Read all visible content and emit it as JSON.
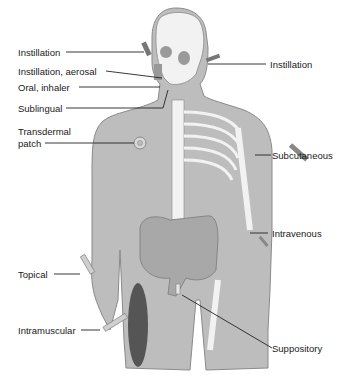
{
  "diagram": {
    "colors": {
      "body": "#bdbdbd",
      "body_outline": "#8a8a8a",
      "bone": "#f2f2f2",
      "organ": "#a8a8a8",
      "muscle": "#555555",
      "leader": "#222222",
      "text": "#1a1a1a"
    },
    "labels": {
      "instillation_eye": "Instillation",
      "instillation_aerosal": "Instillation, aerosal",
      "oral_inhaler": "Oral, inhaler",
      "sublingual": "Sublingual",
      "transdermal_line1": "Transdermal",
      "transdermal_line2": "patch",
      "instillation_ear": "Instillation",
      "subcutaneous": "Subcutaneous",
      "intravenous": "Intravenous",
      "topical": "Topical",
      "intramuscular": "Intramuscular",
      "suppository": "Suppository"
    }
  }
}
